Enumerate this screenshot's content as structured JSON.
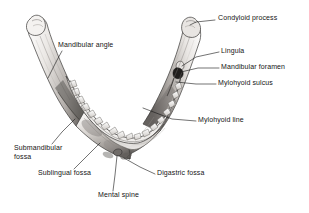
{
  "figure": {
    "background_color": "#ffffff",
    "ink_color": "#141414",
    "bone_light": "#f2f0ee",
    "bone_mid": "#bdb9b5",
    "bone_shadow": "#6f6b68",
    "bone_dark": "#2e2c2b"
  },
  "labels": [
    {
      "id": "condyloid-process",
      "text": "Condyloid process",
      "x": 218,
      "y": 17,
      "side": "right"
    },
    {
      "id": "lingula",
      "text": "Lingula",
      "x": 221,
      "y": 50,
      "side": "right"
    },
    {
      "id": "mandibular-foramen",
      "text": "Mandibular foramen",
      "x": 221,
      "y": 66,
      "side": "right"
    },
    {
      "id": "mylohyoid-sulcus",
      "text": "Mylohyoid sulcus",
      "x": 218,
      "y": 82,
      "side": "right"
    },
    {
      "id": "mylohyoid-line",
      "text": "Mylohyoid line",
      "x": 198,
      "y": 119,
      "side": "right"
    },
    {
      "id": "mandibular-angle",
      "text": "Mandibular angle",
      "x": 58,
      "y": 44,
      "side": "left"
    },
    {
      "id": "submandibular-fossa",
      "text": "Submandibular\nfossa",
      "x": 14,
      "y": 147,
      "side": "left"
    },
    {
      "id": "sublingual-fossa",
      "text": "Sublingual fossa",
      "x": 38,
      "y": 172,
      "side": "left"
    },
    {
      "id": "mental-spine",
      "text": "Mental spine",
      "x": 98,
      "y": 194,
      "side": "left"
    },
    {
      "id": "digastric-fossa",
      "text": "Digastric fossa",
      "x": 157,
      "y": 172,
      "side": "right"
    }
  ],
  "leaders": [
    {
      "id": "leader-condyloid-process",
      "points": "215,20 196,22 190,25"
    },
    {
      "id": "leader-lingula",
      "points": "219,52 196,57 182,66"
    },
    {
      "id": "leader-mandibular-foramen",
      "points": "219,68 198,68 181,72"
    },
    {
      "id": "leader-mylohyoid-sulcus",
      "points": "216,84 196,84 176,82"
    },
    {
      "id": "leader-mylohyoid-line",
      "points": "196,121 172,119 143,108"
    },
    {
      "id": "leader-mandibular-angle",
      "points": "62,51 56,62 48,78"
    },
    {
      "id": "leader-submandibular-fossa",
      "points": "52,144 62,132 75,119"
    },
    {
      "id": "leader-sublingual-fossa",
      "points": "74,169 88,155 100,143"
    },
    {
      "id": "leader-mental-spine",
      "points": "113,191 115,175 117,156"
    },
    {
      "id": "leader-digastric-fossa",
      "points": "155,174 140,167 124,158"
    }
  ],
  "anatomy_parts": [
    {
      "id": "left-condyle",
      "name": "left condyloid process"
    },
    {
      "id": "right-condyle",
      "name": "right condyloid process"
    },
    {
      "id": "left-ramus",
      "name": "left ramus"
    },
    {
      "id": "right-ramus",
      "name": "right ramus"
    },
    {
      "id": "mandibular-body",
      "name": "body of mandible"
    },
    {
      "id": "alveolar-arch",
      "name": "alveolar arch with teeth"
    },
    {
      "id": "mandibular-foramen-opening",
      "name": "mandibular foramen"
    },
    {
      "id": "mental-spine-bump",
      "name": "mental spine"
    }
  ]
}
